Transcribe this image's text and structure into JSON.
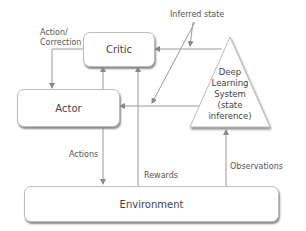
{
  "diagram": {
    "nodes": {
      "critic": {
        "label": "Critic"
      },
      "actor": {
        "label": "Actor"
      },
      "deep_learning": {
        "label_lines": [
          "Deep",
          "Learning",
          "System",
          "(state",
          "inference)"
        ]
      },
      "environment": {
        "label": "Environment"
      }
    },
    "edge_labels": {
      "action_correction": [
        "Action/",
        "Correction"
      ],
      "inferred_state": "Inferred state",
      "actions": "Actions",
      "rewards": "Rewards",
      "observations": "Observations"
    },
    "edges": [
      {
        "from": "critic",
        "to": "actor",
        "label": "Action/Correction"
      },
      {
        "from": "actor",
        "to": "critic",
        "label": ""
      },
      {
        "from": "environment",
        "to": "critic",
        "label": "Rewards"
      },
      {
        "from": "deep_learning",
        "to": "critic",
        "label": "Inferred state"
      },
      {
        "from": "deep_learning",
        "to": "actor",
        "label": "Inferred state"
      },
      {
        "from": "actor",
        "to": "environment",
        "label": "Actions"
      },
      {
        "from": "environment",
        "to": "deep_learning",
        "label": "Observations"
      }
    ],
    "colors": {
      "line": "#9a9a9a",
      "text": "#444444",
      "shadow": "#8a8a8a"
    }
  }
}
